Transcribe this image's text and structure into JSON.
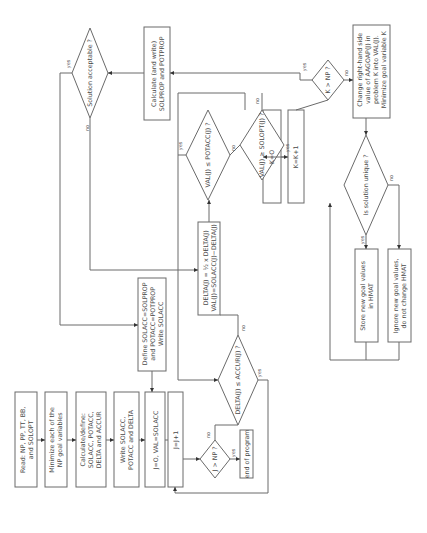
{
  "diagram": {
    "orientation": "rotated 90 degrees counter-clockwise",
    "line_color": "#6a6a6a",
    "nodes": {
      "read": "Read: NP, PP, TT, BB,\nand SOLOPT",
      "minimize": "Minimize each of the\nNP goal variables",
      "calculate_define": "Calculate/define:\nSOLACC, POTACC,\nDELTA and ACCUR",
      "write_solacc": "Write SOLACC,\nPOTACC and DELTA",
      "init_j": "J=O, VAL=SOLACC",
      "j_increment": "J=J+1",
      "j_gt_np": "J > NP ?",
      "end_program": "end of program",
      "delta_leq_accur": "DELTA(J) ≤ ACCUR(J) ?",
      "define_solprop": "Define SOLACC=SOLPROP\nand POTACC=POTPROP\nWrite SOLACC",
      "delta_update": "DELTA(J) = ½ x DELTA(J)\nVAL(J)=SOLACC(J)−DELTA(J)",
      "val_leq_potacc": "VAL(J) ≤ POTACC(J) ?",
      "val_geq_solopt": "VAL(J) ≥ SOLOPT(J) ?",
      "k_zero": "K=O",
      "k_increment": "K=K+1",
      "k_gt_np": "K > NP ?",
      "calculate_write": "Calculate (and write)\nSOLPROP and POTPROP",
      "solution_acceptable": "Solution acceptable ?",
      "change_rhs": "Change right-hand side\nvalue of AAGOAP(J) in\nproblem K into VAL(J).\nMinimize goal variable K",
      "solution_unique": "Is solution unique ?",
      "store_goal": "Store new goal values\nin HMAT",
      "ignore_goal": "Ignore new goal values,\ndo not change HMAT"
    },
    "edge_labels": {
      "yes": "yes",
      "no": "no"
    }
  }
}
